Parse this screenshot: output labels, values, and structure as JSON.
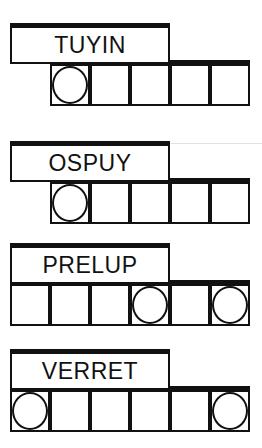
{
  "puzzles": [
    {
      "word": "TUYIN",
      "top": 23,
      "cells": [
        {
          "index": 1,
          "circled": true
        },
        {
          "index": 2,
          "circled": false
        },
        {
          "index": 3,
          "circled": false
        },
        {
          "index": 4,
          "circled": false
        },
        {
          "index": 5,
          "circled": false
        }
      ],
      "first_cell_index": 1
    },
    {
      "word": "OSPUY",
      "top": 141,
      "cells": [
        {
          "index": 1,
          "circled": true
        },
        {
          "index": 2,
          "circled": false
        },
        {
          "index": 3,
          "circled": false
        },
        {
          "index": 4,
          "circled": false
        },
        {
          "index": 5,
          "circled": false
        }
      ],
      "first_cell_index": 1
    },
    {
      "word": "PRELUP",
      "top": 243,
      "cells": [
        {
          "index": 0,
          "circled": false
        },
        {
          "index": 1,
          "circled": false
        },
        {
          "index": 2,
          "circled": false
        },
        {
          "index": 3,
          "circled": true
        },
        {
          "index": 4,
          "circled": false
        },
        {
          "index": 5,
          "circled": true
        }
      ],
      "first_cell_index": 0
    },
    {
      "word": "VERRET",
      "top": 349,
      "cells": [
        {
          "index": 0,
          "circled": true
        },
        {
          "index": 1,
          "circled": false
        },
        {
          "index": 2,
          "circled": false
        },
        {
          "index": 3,
          "circled": false
        },
        {
          "index": 4,
          "circled": false
        },
        {
          "index": 5,
          "circled": true
        }
      ],
      "first_cell_index": 0
    }
  ]
}
